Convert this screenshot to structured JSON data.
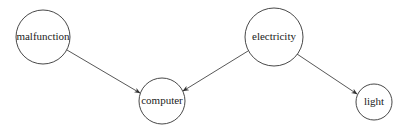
{
  "diagram": {
    "type": "directed-graph",
    "nodes": [
      {
        "id": "malfunction",
        "label": "malfunction",
        "cx": 43,
        "cy": 37,
        "r": 27
      },
      {
        "id": "computer",
        "label": "computer",
        "cx": 162,
        "cy": 101,
        "r": 23
      },
      {
        "id": "electricity",
        "label": "electricity",
        "cx": 274,
        "cy": 37,
        "r": 29
      },
      {
        "id": "light",
        "label": "light",
        "cx": 374,
        "cy": 102,
        "r": 18
      }
    ],
    "edges": [
      {
        "from": "malfunction",
        "to": "computer"
      },
      {
        "from": "electricity",
        "to": "computer"
      },
      {
        "from": "electricity",
        "to": "light"
      }
    ]
  }
}
